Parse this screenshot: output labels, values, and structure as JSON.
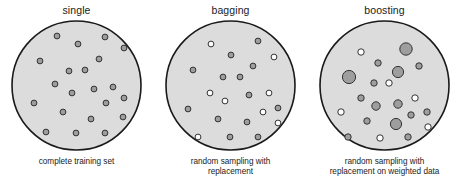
{
  "figure": {
    "background_color": "#ffffff",
    "disc_fill": "#dcdcdc",
    "disc_stroke": "#1a1a1a",
    "dot_gray_fill": "#9e9e9e",
    "dot_white_fill": "#ffffff",
    "dot_stroke": "#333333"
  },
  "panels": [
    {
      "id": "single",
      "title": "single",
      "caption_lines": [
        "complete training set"
      ],
      "disc": {
        "cx": 66.5,
        "cy": 66.5,
        "r": 64.5
      },
      "dots": [
        {
          "x": 47,
          "y": 17,
          "r": 2.9,
          "fill": "gray"
        },
        {
          "x": 68,
          "y": 25,
          "r": 2.9,
          "fill": "gray"
        },
        {
          "x": 95,
          "y": 18,
          "r": 2.9,
          "fill": "gray"
        },
        {
          "x": 114,
          "y": 29,
          "r": 2.9,
          "fill": "gray"
        },
        {
          "x": 30,
          "y": 42,
          "r": 2.9,
          "fill": "gray"
        },
        {
          "x": 89,
          "y": 40,
          "r": 2.9,
          "fill": "gray"
        },
        {
          "x": 59,
          "y": 52,
          "r": 2.9,
          "fill": "gray"
        },
        {
          "x": 75,
          "y": 51,
          "r": 2.9,
          "fill": "gray"
        },
        {
          "x": 45,
          "y": 65,
          "r": 2.9,
          "fill": "gray"
        },
        {
          "x": 103,
          "y": 68,
          "r": 2.9,
          "fill": "gray"
        },
        {
          "x": 62,
          "y": 74,
          "r": 2.9,
          "fill": "gray"
        },
        {
          "x": 84,
          "y": 70,
          "r": 2.9,
          "fill": "gray"
        },
        {
          "x": 24,
          "y": 84,
          "r": 2.9,
          "fill": "gray"
        },
        {
          "x": 96,
          "y": 84,
          "r": 2.9,
          "fill": "gray"
        },
        {
          "x": 114,
          "y": 79,
          "r": 2.9,
          "fill": "gray"
        },
        {
          "x": 53,
          "y": 93,
          "r": 2.9,
          "fill": "gray"
        },
        {
          "x": 81,
          "y": 100,
          "r": 2.9,
          "fill": "gray"
        },
        {
          "x": 113,
          "y": 98,
          "r": 2.9,
          "fill": "gray"
        },
        {
          "x": 36,
          "y": 113,
          "r": 2.9,
          "fill": "gray"
        },
        {
          "x": 66,
          "y": 114,
          "r": 2.9,
          "fill": "gray"
        },
        {
          "x": 95,
          "y": 114,
          "r": 2.9,
          "fill": "gray"
        }
      ]
    },
    {
      "id": "bagging",
      "title": "bagging",
      "caption_lines": [
        "random sampling with",
        "replacement"
      ],
      "disc": {
        "cx": 66.5,
        "cy": 66.5,
        "r": 64.5
      },
      "dots": [
        {
          "x": 47,
          "y": 25,
          "r": 2.9,
          "fill": "white"
        },
        {
          "x": 94,
          "y": 22,
          "r": 2.9,
          "fill": "gray"
        },
        {
          "x": 67,
          "y": 36,
          "r": 2.9,
          "fill": "gray"
        },
        {
          "x": 110,
          "y": 38,
          "r": 2.9,
          "fill": "white"
        },
        {
          "x": 29,
          "y": 51,
          "r": 2.9,
          "fill": "gray"
        },
        {
          "x": 89,
          "y": 47,
          "r": 2.9,
          "fill": "gray"
        },
        {
          "x": 59,
          "y": 58,
          "r": 2.9,
          "fill": "gray"
        },
        {
          "x": 76,
          "y": 58,
          "r": 2.9,
          "fill": "gray"
        },
        {
          "x": 46,
          "y": 74,
          "r": 2.9,
          "fill": "white"
        },
        {
          "x": 61,
          "y": 82,
          "r": 2.9,
          "fill": "white"
        },
        {
          "x": 85,
          "y": 76,
          "r": 2.9,
          "fill": "gray"
        },
        {
          "x": 105,
          "y": 74,
          "r": 2.9,
          "fill": "white"
        },
        {
          "x": 24,
          "y": 90,
          "r": 2.9,
          "fill": "gray"
        },
        {
          "x": 99,
          "y": 93,
          "r": 2.9,
          "fill": "white"
        },
        {
          "x": 114,
          "y": 89,
          "r": 2.9,
          "fill": "gray"
        },
        {
          "x": 54,
          "y": 100,
          "r": 2.9,
          "fill": "gray"
        },
        {
          "x": 83,
          "y": 103,
          "r": 2.9,
          "fill": "gray"
        },
        {
          "x": 114,
          "y": 104,
          "r": 2.9,
          "fill": "white"
        },
        {
          "x": 34,
          "y": 118,
          "r": 2.9,
          "fill": "white"
        },
        {
          "x": 66,
          "y": 118,
          "r": 2.9,
          "fill": "gray"
        },
        {
          "x": 94,
          "y": 118,
          "r": 2.9,
          "fill": "gray"
        }
      ]
    },
    {
      "id": "boosting",
      "title": "boosting",
      "caption_lines": [
        "random sampling with",
        "replacement on weighted data"
      ],
      "disc": {
        "cx": 66.5,
        "cy": 66.5,
        "r": 64.5
      },
      "dots": [
        {
          "x": 43,
          "y": 33,
          "r": 3.2,
          "fill": "white"
        },
        {
          "x": 88,
          "y": 30,
          "r": 6.2,
          "fill": "gray"
        },
        {
          "x": 60,
          "y": 44,
          "r": 3.2,
          "fill": "gray"
        },
        {
          "x": 80,
          "y": 53,
          "r": 5.6,
          "fill": "gray"
        },
        {
          "x": 101,
          "y": 47,
          "r": 3.2,
          "fill": "gray"
        },
        {
          "x": 31,
          "y": 58,
          "r": 6.6,
          "fill": "gray"
        },
        {
          "x": 56,
          "y": 64,
          "r": 3.2,
          "fill": "gray"
        },
        {
          "x": 71,
          "y": 64,
          "r": 3.2,
          "fill": "white"
        },
        {
          "x": 43,
          "y": 79,
          "r": 3.2,
          "fill": "gray"
        },
        {
          "x": 58,
          "y": 87,
          "r": 4.2,
          "fill": "gray"
        },
        {
          "x": 80,
          "y": 85,
          "r": 4.2,
          "fill": "gray"
        },
        {
          "x": 97,
          "y": 79,
          "r": 3.2,
          "fill": "white"
        },
        {
          "x": 23,
          "y": 93,
          "r": 3.2,
          "fill": "white"
        },
        {
          "x": 93,
          "y": 96,
          "r": 3.2,
          "fill": "gray"
        },
        {
          "x": 109,
          "y": 93,
          "r": 3.2,
          "fill": "gray"
        },
        {
          "x": 49,
          "y": 102,
          "r": 3.2,
          "fill": "gray"
        },
        {
          "x": 78,
          "y": 105,
          "r": 5.6,
          "fill": "gray"
        },
        {
          "x": 110,
          "y": 108,
          "r": 3.2,
          "fill": "white"
        },
        {
          "x": 30,
          "y": 118,
          "r": 3.2,
          "fill": "gray"
        },
        {
          "x": 62,
          "y": 119,
          "r": 3.2,
          "fill": "white"
        },
        {
          "x": 90,
          "y": 118,
          "r": 3.2,
          "fill": "gray"
        }
      ]
    }
  ]
}
